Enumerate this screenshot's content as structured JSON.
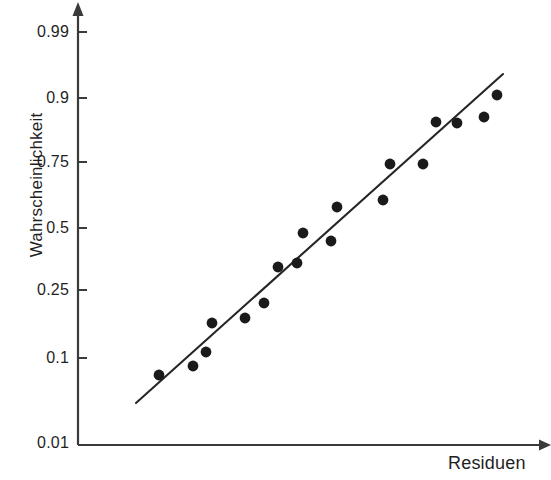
{
  "chart_data": {
    "type": "scatter",
    "title": "",
    "subtitle": "",
    "xlabel": "Residuen",
    "ylabel": "Wahrscheinlichkeit",
    "grid": false,
    "legend": null,
    "y_scale": "probability",
    "y_tick_labels": [
      "0.99",
      "0.9",
      "0.75",
      "0.5",
      "0.25",
      "0.1",
      "0.01"
    ],
    "y_tick_values": [
      0.99,
      0.9,
      0.75,
      0.5,
      0.25,
      0.1,
      0.01
    ],
    "y_tick_pixels": [
      32,
      98,
      162,
      228,
      290,
      358,
      443
    ],
    "ylim": [
      0.01,
      0.99
    ],
    "x_tick_labels": [],
    "xlim": [
      0,
      1
    ],
    "point_color": "#1a1a1a",
    "line_color": "#262626",
    "axis_color": "#3a3a3a",
    "points": [
      {
        "x": 0.178,
        "y": 0.102,
        "px": 159,
        "py": 375
      },
      {
        "x": 0.253,
        "y": 0.128,
        "px": 193,
        "py": 366
      },
      {
        "x": 0.282,
        "y": 0.163,
        "px": 206,
        "py": 352
      },
      {
        "x": 0.295,
        "y": 0.21,
        "px": 212,
        "py": 323
      },
      {
        "x": 0.368,
        "y": 0.218,
        "px": 245,
        "py": 318
      },
      {
        "x": 0.41,
        "y": 0.268,
        "px": 264,
        "py": 303
      },
      {
        "x": 0.44,
        "y": 0.398,
        "px": 278,
        "py": 267
      },
      {
        "x": 0.481,
        "y": 0.418,
        "px": 297,
        "py": 263
      },
      {
        "x": 0.494,
        "y": 0.52,
        "px": 303,
        "py": 233
      },
      {
        "x": 0.556,
        "y": 0.494,
        "px": 331,
        "py": 241
      },
      {
        "x": 0.569,
        "y": 0.608,
        "px": 337,
        "py": 207
      },
      {
        "x": 0.67,
        "y": 0.648,
        "px": 383,
        "py": 200
      },
      {
        "x": 0.684,
        "y": 0.745,
        "px": 390,
        "py": 164
      },
      {
        "x": 0.756,
        "y": 0.758,
        "px": 423,
        "py": 164
      },
      {
        "x": 0.784,
        "y": 0.855,
        "px": 436,
        "py": 122
      },
      {
        "x": 0.83,
        "y": 0.848,
        "px": 457,
        "py": 123
      },
      {
        "x": 0.889,
        "y": 0.868,
        "px": 484,
        "py": 117
      },
      {
        "x": 0.917,
        "y": 0.912,
        "px": 497,
        "py": 95
      }
    ],
    "reference_line": {
      "x_start_px": 136,
      "y_start_px": 403,
      "x_end_px": 503,
      "y_end_px": 74,
      "y_start_value": 0.073,
      "y_end_value": 0.955
    },
    "axes": {
      "x_axis_start_px": 78,
      "x_axis_end_px": 548,
      "x_axis_y_px": 445,
      "y_axis_x_px": 78,
      "y_axis_top_px": 8,
      "y_axis_bottom_px": 445,
      "arrowheads": [
        "x-right",
        "y-top"
      ]
    }
  }
}
